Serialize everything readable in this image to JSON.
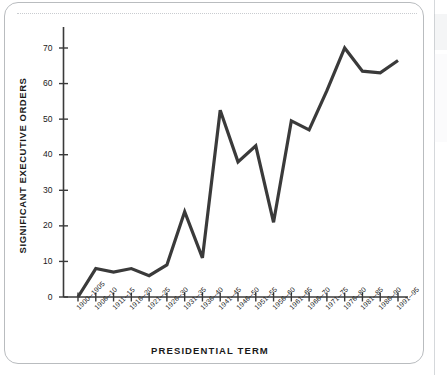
{
  "chart_data": {
    "type": "line",
    "title": "",
    "xlabel": "PRESIDENTIAL TERM",
    "ylabel": "SIGNIFICANT EXECUTIVE ORDERS",
    "categories": [
      "1900--1905",
      "1906--10",
      "1911--15",
      "1916--20",
      "1921--25",
      "1926--30",
      "1931--35",
      "1936--40",
      "1941--45",
      "1946--50",
      "1951--55",
      "1956--60",
      "1961--65",
      "1966--70",
      "1971--75",
      "1976--80",
      "1981--85",
      "1986--90",
      "1991--95"
    ],
    "values": [
      0,
      8,
      7,
      8,
      6,
      9,
      24,
      11,
      52.5,
      38,
      42.5,
      21,
      49.5,
      47,
      58,
      70,
      63.5,
      63,
      66.5
    ],
    "ylim": [
      0,
      75
    ],
    "yticks": [
      0,
      10,
      20,
      30,
      40,
      50,
      60,
      70
    ],
    "ytick_labels": [
      "0",
      "10",
      "20",
      "30",
      "40",
      "50",
      "60",
      "70"
    ],
    "grid": false,
    "legend": null,
    "line_color": "#3a3a3a",
    "axis_color": "#3a3a3a"
  },
  "figure": {
    "card_border_color": "#b9bcbf",
    "background_color": "#ffffff"
  }
}
